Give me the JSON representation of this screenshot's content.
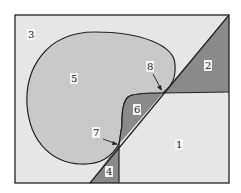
{
  "diagram": {
    "regions": [
      {
        "id": "1",
        "label": "1",
        "shade": "light"
      },
      {
        "id": "2",
        "label": "2",
        "shade": "dark"
      },
      {
        "id": "3",
        "label": "3",
        "shade": "light"
      },
      {
        "id": "4",
        "label": "4",
        "shade": "dark"
      },
      {
        "id": "5",
        "label": "5",
        "shade": "medium"
      },
      {
        "id": "6",
        "label": "6",
        "shade": "dark"
      }
    ],
    "points": [
      {
        "id": "7",
        "label": "7"
      },
      {
        "id": "8",
        "label": "8"
      }
    ],
    "colors": {
      "background": "#e6e6e6",
      "medium": "#c9c9c9",
      "dark": "#8a8a8a",
      "stroke": "#222222"
    }
  }
}
